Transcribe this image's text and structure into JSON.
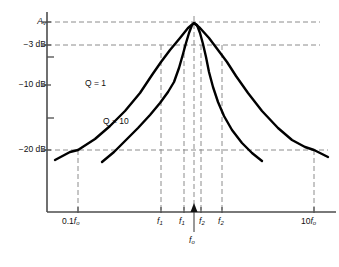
{
  "chart_data": {
    "type": "line",
    "title": "",
    "subtitle": "",
    "xlabel": "",
    "ylabel": "",
    "grid": "dashed-guides",
    "legend": "inline-curve-labels",
    "axis": {
      "x_range_label": [
        "0.1f_o",
        "10f_o"
      ],
      "y_levels_db": [
        0,
        -3,
        -10,
        -20
      ]
    },
    "y_ticks": [
      {
        "label": "A_v",
        "display": "A",
        "sub": "v",
        "db": 0,
        "y": 22
      },
      {
        "label": "-3 dB",
        "display": "−3 dB",
        "db": -3,
        "y": 45
      },
      {
        "label": "",
        "display": "",
        "db": -5,
        "y": 57
      },
      {
        "label": "-10 dB",
        "display": "−10 dB",
        "db": -10,
        "y": 85
      },
      {
        "label": "",
        "display": "",
        "db": -15,
        "y": 118
      },
      {
        "label": "-20 dB",
        "display": "−20 dB",
        "db": -20,
        "y": 150
      }
    ],
    "x_ticks": [
      {
        "id": "0.1fo",
        "display": "0.1f",
        "sub": "o",
        "x": 78
      },
      {
        "id": "f1_q1",
        "display": "f",
        "sub": "1",
        "x": 161
      },
      {
        "id": "f1_q10",
        "display": "f",
        "sub": "1",
        "x": 184
      },
      {
        "id": "fo",
        "display": "f",
        "sub": "o",
        "x": 194
      },
      {
        "id": "f2_q10",
        "display": "f",
        "sub": "2",
        "x": 201
      },
      {
        "id": "f2_q1",
        "display": "f",
        "sub": "2",
        "x": 222
      },
      {
        "id": "10fo",
        "display": "10f",
        "sub": "o",
        "x": 314
      }
    ],
    "series": [
      {
        "name": "Q = 1",
        "label": "Q = 1",
        "q": 1,
        "peak_db": 0,
        "minus3db_points": [
          "f1_q1",
          "f2_q1"
        ],
        "minus20db_points": [
          "0.1fo",
          "10fo"
        ],
        "points": [
          [
            55,
            160
          ],
          [
            70,
            152
          ],
          [
            78,
            150
          ],
          [
            95,
            139
          ],
          [
            110,
            126
          ],
          [
            125,
            111
          ],
          [
            140,
            93
          ],
          [
            152,
            75
          ],
          [
            161,
            62
          ],
          [
            170,
            50
          ],
          [
            180,
            38
          ],
          [
            188,
            28
          ],
          [
            194,
            23
          ],
          [
            200,
            28
          ],
          [
            209,
            38
          ],
          [
            218,
            50
          ],
          [
            227,
            62
          ],
          [
            236,
            76
          ],
          [
            248,
            93
          ],
          [
            262,
            111
          ],
          [
            278,
            128
          ],
          [
            292,
            140
          ],
          [
            305,
            147
          ],
          [
            314,
            150
          ],
          [
            328,
            157
          ]
        ]
      },
      {
        "name": "Q = 10",
        "label": "Q = 10",
        "q": 10,
        "peak_db": 0,
        "minus3db_points": [
          "f1_q10",
          "f2_q10"
        ],
        "points": [
          [
            102,
            162
          ],
          [
            114,
            152
          ],
          [
            126,
            140
          ],
          [
            138,
            128
          ],
          [
            150,
            115
          ],
          [
            160,
            103
          ],
          [
            168,
            92
          ],
          [
            174,
            82
          ],
          [
            179,
            68
          ],
          [
            183,
            54
          ],
          [
            186,
            43
          ],
          [
            189,
            33
          ],
          [
            192,
            25
          ],
          [
            194,
            23
          ],
          [
            197,
            25
          ],
          [
            200,
            33
          ],
          [
            203,
            44
          ],
          [
            206,
            57
          ],
          [
            209,
            72
          ],
          [
            213,
            87
          ],
          [
            218,
            102
          ],
          [
            224,
            116
          ],
          [
            232,
            130
          ],
          [
            242,
            143
          ],
          [
            252,
            153
          ],
          [
            262,
            161
          ]
        ]
      }
    ],
    "curve_labels": [
      {
        "text": "Q = 1",
        "x": 85,
        "y": 83
      },
      {
        "text": "Q = 10",
        "x": 103,
        "y": 121
      }
    ],
    "colors": {
      "curve": "#000000",
      "axis": "#4d4d4d",
      "guide": "#8c8c8c",
      "background": "#ffffff"
    }
  }
}
